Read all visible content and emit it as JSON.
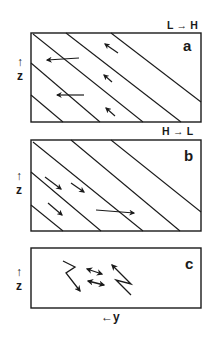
{
  "figure": {
    "panels": [
      {
        "id": "a",
        "letter": "a",
        "corner_label": "L → H",
        "axis_label": "z",
        "axis_arrow": "↑",
        "description": "sloping isentropes; flow arrows pointing left / up-left"
      },
      {
        "id": "b",
        "letter": "b",
        "corner_label": "H → L",
        "axis_label": "z",
        "axis_arrow": "↑",
        "description": "sloping isentropes; flow arrows pointing right / down-right"
      },
      {
        "id": "c",
        "letter": "c",
        "axis_label": "z",
        "axis_arrow": "↑",
        "description": "zigzag arrows and double-headed horizontal arrows"
      }
    ],
    "bottom_axis": {
      "arrow": "←",
      "label": "y"
    },
    "colors": {
      "ink": "#1a1a1a",
      "background": "#ffffff"
    }
  }
}
